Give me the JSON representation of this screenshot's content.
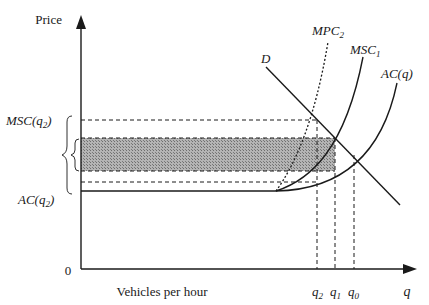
{
  "diagram": {
    "y_axis_label": "Price",
    "x_axis_label": "Vehicles per hour",
    "x_axis_var": "q",
    "origin_label": "0",
    "curves": {
      "demand": "D",
      "mpc": {
        "base": "MPC",
        "sub": "2"
      },
      "msc": {
        "base": "MSC",
        "sub": "1"
      },
      "ac": "AC(q)"
    },
    "y_labels": {
      "msc_q2": {
        "base": "MSC(q",
        "sub": "2",
        "close": ")"
      },
      "ac_q2": {
        "base": "AC(q",
        "sub": "2",
        "close": ")"
      }
    },
    "x_ticks": [
      {
        "base": "q",
        "sub": "2"
      },
      {
        "base": "q",
        "sub": "1"
      },
      {
        "base": "q",
        "sub": "0"
      }
    ],
    "colors": {
      "line": "#1a1a1a",
      "shade": "#8c8c8c"
    }
  }
}
